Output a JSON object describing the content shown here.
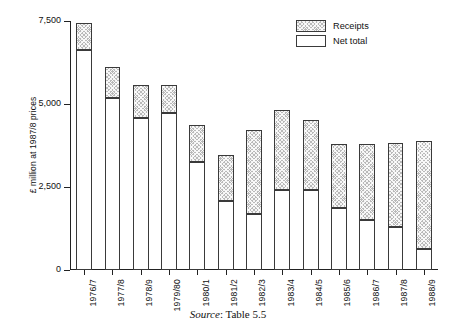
{
  "chart_data": {
    "type": "bar",
    "stacked": true,
    "title": "",
    "subtitle": "",
    "xlabel": "",
    "ylabel": "£ million at 1987/8 prices",
    "ylim": [
      0,
      7500
    ],
    "yticks": [
      0,
      2500,
      5000,
      7500
    ],
    "ytick_labels": [
      "0",
      "2,500",
      "5,000",
      "7,500"
    ],
    "grid": false,
    "legend_position": "top-right",
    "categories": [
      "1976/7",
      "1977/8",
      "1978/9",
      "1979/80",
      "1980/1",
      "1981/2",
      "1982/3",
      "1983/4",
      "1984/5",
      "1985/6",
      "1986/7",
      "1987/8",
      "1988/9"
    ],
    "series": [
      {
        "name": "Net total",
        "fill": "white",
        "values": [
          6640,
          5180,
          4575,
          4730,
          3240,
          2090,
          1700,
          2395,
          2395,
          1880,
          1515,
          1300,
          640
        ]
      },
      {
        "name": "Receipts",
        "fill": "hatched-grey",
        "values": [
          785,
          940,
          1000,
          845,
          1120,
          1360,
          2510,
          2420,
          2120,
          1910,
          2275,
          2515,
          3260
        ]
      }
    ],
    "totals": [
      7425,
      6120,
      5575,
      5575,
      4360,
      3450,
      4210,
      4815,
      4515,
      3790,
      3790,
      3815,
      3900
    ]
  },
  "legend": {
    "items": [
      {
        "label": "Receipts",
        "swatch": "hatched-grey"
      },
      {
        "label": "Net total",
        "swatch": "white"
      }
    ]
  },
  "source": {
    "prefix": "Source",
    "separator": ": ",
    "reference": "Table 5.5"
  },
  "colors": {
    "axis": "#222222",
    "bar_outline": "#3a3a3a",
    "receipts_fill": "#b9b9b9",
    "net_total_fill": "#ffffff",
    "background": "#ffffff",
    "text": "#111111"
  }
}
